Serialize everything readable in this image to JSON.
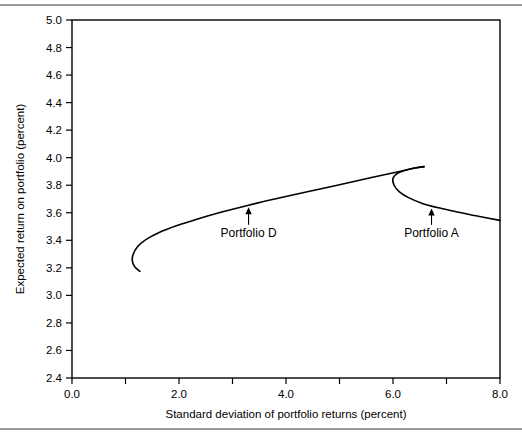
{
  "figure": {
    "name": "efficient-frontier-chart",
    "background": "#ffffff",
    "line_color": "#000000",
    "frame_color": "#000000",
    "rule_color": "#9a9a9a"
  },
  "chart_data": {
    "type": "line",
    "title": "",
    "xlabel": "Standard deviation of portfolio returns (percent)",
    "ylabel": "Expected return on portfolio (percent)",
    "xlim": [
      0.0,
      8.0
    ],
    "ylim": [
      2.4,
      5.0
    ],
    "grid": false,
    "legend": "none",
    "x_ticks_labeled": [
      "0.0",
      "2.0",
      "4.0",
      "6.0",
      "8.0"
    ],
    "x_tick_values": [
      0.0,
      2.0,
      4.0,
      6.0,
      8.0
    ],
    "x_minor_tick_values": [
      1.0,
      3.0,
      5.0,
      7.0
    ],
    "y_ticks_labeled": [
      "2.4",
      "2.6",
      "2.8",
      "3.0",
      "3.2",
      "3.4",
      "3.6",
      "3.8",
      "4.0",
      "4.2",
      "4.4",
      "4.6",
      "4.8",
      "5.0"
    ],
    "y_tick_values": [
      2.4,
      2.6,
      2.8,
      3.0,
      3.2,
      3.4,
      3.6,
      3.8,
      4.0,
      4.2,
      4.4,
      4.6,
      4.8,
      5.0
    ],
    "series": [
      {
        "name": "efficient-frontier-upper-branch",
        "points": [
          [
            1.27,
            3.175
          ],
          [
            1.18,
            3.205
          ],
          [
            1.13,
            3.245
          ],
          [
            1.14,
            3.295
          ],
          [
            1.22,
            3.352
          ],
          [
            1.38,
            3.405
          ],
          [
            1.62,
            3.455
          ],
          [
            1.95,
            3.505
          ],
          [
            2.35,
            3.555
          ],
          [
            2.8,
            3.605
          ],
          [
            3.3,
            3.655
          ],
          [
            3.85,
            3.705
          ],
          [
            4.42,
            3.755
          ],
          [
            5.02,
            3.805
          ],
          [
            5.62,
            3.858
          ],
          [
            6.1,
            3.898
          ],
          [
            6.42,
            3.925
          ],
          [
            6.58,
            3.935
          ]
        ]
      },
      {
        "name": "efficient-frontier-lower-branch",
        "points": [
          [
            6.58,
            3.935
          ],
          [
            6.32,
            3.918
          ],
          [
            6.1,
            3.89
          ],
          [
            6.0,
            3.85
          ],
          [
            6.02,
            3.8
          ],
          [
            6.12,
            3.752
          ],
          [
            6.3,
            3.708
          ],
          [
            6.55,
            3.668
          ],
          [
            6.85,
            3.636
          ],
          [
            7.18,
            3.608
          ],
          [
            7.55,
            3.578
          ],
          [
            8.0,
            3.545
          ]
        ]
      }
    ],
    "annotations": [
      {
        "name": "portfolio-d-annotation",
        "label": "Portfolio  D",
        "point_x": 3.3,
        "point_y": 3.655,
        "label_x": 3.3,
        "label_y": 3.425,
        "arrow": "up"
      },
      {
        "name": "portfolio-a-annotation",
        "label": "Portfolio  A",
        "point_x": 6.72,
        "point_y": 3.645,
        "label_x": 6.72,
        "label_y": 3.425,
        "arrow": "up"
      }
    ]
  }
}
